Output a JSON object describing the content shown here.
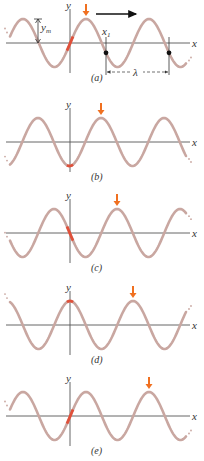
{
  "colors": {
    "wave": "#c9a7a1",
    "marker": "#f07020",
    "origin_highlight": "#e0503a",
    "axis": "#555555",
    "text": "#333333"
  },
  "diagram": {
    "wavelength_px": 63,
    "amplitude_px": 24,
    "panels": [
      {
        "id": "a",
        "caption": "(a)",
        "axis_y": 43,
        "crest_marker_x": 86,
        "phase": "rising-through-origin",
        "labels": {
          "y": "y",
          "x": "x",
          "amplitude": "y",
          "amplitude_sub": "m",
          "x1": "x",
          "x1_sub": "1",
          "wavelength": "λ"
        },
        "direction_arrow": "→"
      },
      {
        "id": "b",
        "caption": "(b)",
        "axis_y": 142,
        "crest_marker_x": 101,
        "phase": "trough-at-origin",
        "labels": {
          "y": "y",
          "x": "x"
        }
      },
      {
        "id": "c",
        "caption": "(c)",
        "axis_y": 233,
        "crest_marker_x": 117,
        "phase": "falling-through-origin",
        "labels": {
          "y": "y",
          "x": "x"
        }
      },
      {
        "id": "d",
        "caption": "(d)",
        "axis_y": 325,
        "crest_marker_x": 133,
        "phase": "crest-at-origin",
        "labels": {
          "y": "y",
          "x": "x"
        }
      },
      {
        "id": "e",
        "caption": "(e)",
        "axis_y": 416,
        "crest_marker_x": 149,
        "phase": "rising-through-origin",
        "labels": {
          "y": "y",
          "x": "x"
        }
      }
    ]
  }
}
